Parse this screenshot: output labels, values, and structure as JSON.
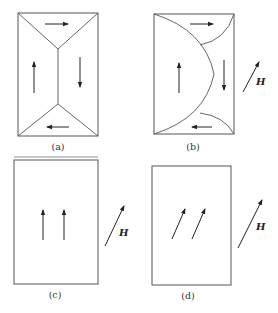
{
  "figure": {
    "panels": [
      {
        "id": "a",
        "caption": "(a)",
        "description": "Four closure domains separated by domain walls; magnetization circulates (right, down, left, up)",
        "field_label": ""
      },
      {
        "id": "b",
        "caption": "(b)",
        "description": "Domain with magnetization along field grows; curved walls",
        "field_label": "H"
      },
      {
        "id": "c",
        "caption": "(c)",
        "description": "Single domain, magnetization up",
        "field_label": "H"
      },
      {
        "id": "d",
        "caption": "(d)",
        "description": "Single domain, magnetization rotated toward field",
        "field_label": "H"
      }
    ],
    "colors": {
      "line": "#555555",
      "arrow": "#222222",
      "background": "#ffffff"
    }
  }
}
